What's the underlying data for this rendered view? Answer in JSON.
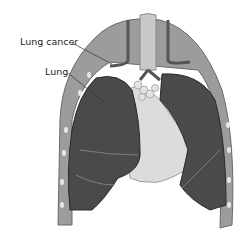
{
  "figure": {
    "style": "grayscale",
    "labels": [
      {
        "text": "Lung cancer",
        "target": "upper part of left-side lung near the bronchi"
      },
      {
        "text": "Lung",
        "target": "left-side lung lobe"
      }
    ]
  },
  "colors": {
    "background": "#ffffff",
    "lung": "#4a4a4a",
    "ribcage": "#9a9a9a",
    "heart_area": "#dcdcdc",
    "label_text": "#222222",
    "leader_line": "#333333"
  }
}
